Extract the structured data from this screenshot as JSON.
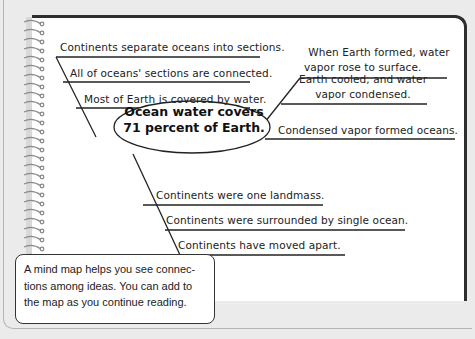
{
  "mind_map": {
    "center": {
      "line1": "Ocean water covers",
      "line2": "71 percent of Earth."
    },
    "upper_left_branches": [
      {
        "label": "Continents separate oceans into sections."
      },
      {
        "label": "All of oceans' sections are connected."
      },
      {
        "label": "Most of Earth is covered by water."
      }
    ],
    "upper_right_branches": [
      {
        "line1": "When Earth formed, water",
        "line2": "vapor rose to surface."
      },
      {
        "line1": "Earth cooled, and water",
        "line2": "vapor condensed."
      },
      {
        "label": "Condensed vapor formed oceans."
      }
    ],
    "lower_branches": [
      {
        "label": "Continents were one landmass."
      },
      {
        "label": "Continents were surrounded by single ocean."
      },
      {
        "label": "Continents have moved apart."
      }
    ]
  },
  "caption": {
    "text": "A mind map helps you see connec-tions among ideas. You can add to the map as you continue reading."
  },
  "colors": {
    "page_background": "#ffffff",
    "outer_background": "#ebebeb",
    "border": "#2e2e2e",
    "text": "#222222"
  }
}
